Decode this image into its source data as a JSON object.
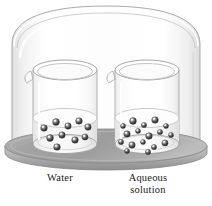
{
  "figure": {
    "name": "bell-jar-vapor-pressure-diagram",
    "background_color": "#ffffff",
    "width": 212,
    "height": 206
  },
  "bell_jar": {
    "name": "bell-jar",
    "description": "transparent domed glass cover",
    "outline_color": "#9a9a9a",
    "glass_fill": "#fbfbfb"
  },
  "base_plate": {
    "name": "base-plate",
    "description": "gray elliptical platform",
    "top_color": "#a8a8a8",
    "edge_color": "#8d8d8d"
  },
  "beakers": [
    {
      "id": "left",
      "label": "Water",
      "glass_color": "#cfcfcf",
      "liquid_color": "#f0f0f0",
      "particle_color": "#4a4a4a",
      "particle_count": 10,
      "particles": [
        {
          "x": 44,
          "y": 128,
          "r": 3.3
        },
        {
          "x": 56,
          "y": 122,
          "r": 3.4
        },
        {
          "x": 68,
          "y": 126,
          "r": 3.2
        },
        {
          "x": 79,
          "y": 121,
          "r": 3.3
        },
        {
          "x": 88,
          "y": 127,
          "r": 3.2
        },
        {
          "x": 50,
          "y": 138,
          "r": 3.4
        },
        {
          "x": 62,
          "y": 135,
          "r": 3.2
        },
        {
          "x": 75,
          "y": 140,
          "r": 3.3
        },
        {
          "x": 85,
          "y": 137,
          "r": 3.1
        },
        {
          "x": 57,
          "y": 147,
          "r": 3.3
        }
      ]
    },
    {
      "id": "right",
      "label": "Aqueous\nsolution",
      "glass_color": "#cfcfcf",
      "liquid_color": "#f0f0f0",
      "particle_color": "#4a4a4a",
      "particle_count": 17,
      "particles": [
        {
          "x": 123,
          "y": 126,
          "r": 2.5
        },
        {
          "x": 133,
          "y": 121,
          "r": 3.4
        },
        {
          "x": 144,
          "y": 125,
          "r": 2.6
        },
        {
          "x": 155,
          "y": 120,
          "r": 3.3
        },
        {
          "x": 166,
          "y": 126,
          "r": 2.5
        },
        {
          "x": 127,
          "y": 134,
          "r": 3.2
        },
        {
          "x": 138,
          "y": 131,
          "r": 2.5
        },
        {
          "x": 149,
          "y": 136,
          "r": 3.3
        },
        {
          "x": 160,
          "y": 132,
          "r": 2.6
        },
        {
          "x": 171,
          "y": 135,
          "r": 2.5
        },
        {
          "x": 121,
          "y": 142,
          "r": 2.6
        },
        {
          "x": 132,
          "y": 145,
          "r": 3.2
        },
        {
          "x": 143,
          "y": 142,
          "r": 2.5
        },
        {
          "x": 154,
          "y": 147,
          "r": 2.6
        },
        {
          "x": 165,
          "y": 143,
          "r": 3.1
        },
        {
          "x": 127,
          "y": 151,
          "r": 2.5
        },
        {
          "x": 148,
          "y": 152,
          "r": 2.6
        }
      ]
    }
  ],
  "labels": {
    "water": "Water",
    "aqueous_solution": "Aqueous\nsolution"
  }
}
